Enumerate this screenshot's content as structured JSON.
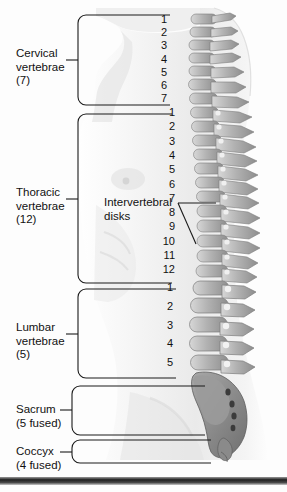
{
  "figure": {
    "background_color": "#fdfdfd",
    "line_color": "#1a1a1a",
    "body_fill": "#f2f2f2",
    "bone_fill": "#b9b9b9",
    "bone_shade": "#8f8f8f",
    "bottom_band_color": "#2b2b2b"
  },
  "regions": [
    {
      "id": "cervical",
      "name_line1": "Cervical",
      "name_line2": "vertebrae",
      "count_label": "(7)",
      "count": 7,
      "numbers": [
        "1",
        "2",
        "3",
        "4",
        "5",
        "6",
        "7"
      ]
    },
    {
      "id": "thoracic",
      "name_line1": "Thoracic",
      "name_line2": "vertebrae",
      "count_label": "(12)",
      "count": 12,
      "numbers": [
        "1",
        "2",
        "3",
        "4",
        "5",
        "6",
        "7",
        "8",
        "9",
        "10",
        "11",
        "12"
      ]
    },
    {
      "id": "lumbar",
      "name_line1": "Lumbar",
      "name_line2": "vertebrae",
      "count_label": "(5)",
      "count": 5,
      "numbers": [
        "1",
        "2",
        "3",
        "4",
        "5"
      ]
    },
    {
      "id": "sacrum",
      "name_line1": "Sacrum",
      "name_line2": "",
      "count_label": "(5 fused)",
      "count": 5,
      "numbers": []
    },
    {
      "id": "coccyx",
      "name_line1": "Coccyx",
      "name_line2": "",
      "count_label": "(4 fused)",
      "count": 4,
      "numbers": []
    }
  ],
  "callout": {
    "line1": "Intervertebral",
    "line2": "disks"
  }
}
